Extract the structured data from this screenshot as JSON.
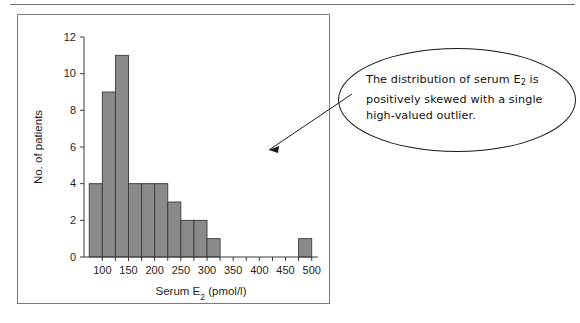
{
  "page": {
    "background": "#ffffff",
    "top_rule_color": "#6e6e6e"
  },
  "chart_panel": {
    "border_color": "#7a7a7a"
  },
  "callout": {
    "shape": "ellipse",
    "border_color": "#1a1a1a",
    "text_line_1": "The distribution of serum E",
    "text_sub_1": "2",
    "text_line_1b": " is",
    "text_line_2": "positively skewed with a single",
    "text_line_3": "high-valued outlier.",
    "full_text": "The distribution of serum E2 is positively skewed with a single high-valued outlier."
  },
  "annotation": {
    "arrow_color": "#1a1a1a",
    "arrow_from": "callout-ellipse-left",
    "arrow_to": "histogram-plot-area"
  },
  "chart_data": {
    "type": "bar",
    "subtype": "histogram",
    "title": "",
    "xlabel": "Serum E2 (pmol/l)",
    "xlabel_base": "Serum E",
    "xlabel_sub": "2",
    "xlabel_tail": " (pmol/l)",
    "ylabel": "No. of patients",
    "bar_color": "#8a8a8a",
    "bar_edge_color": "#3a3a3a",
    "axis_color": "#3a3a3a",
    "grid": false,
    "legend": "none",
    "xlim": [
      65,
      512
    ],
    "ylim": [
      0,
      12
    ],
    "ytick_values": [
      0,
      2,
      4,
      6,
      8,
      10,
      12
    ],
    "ytick_labels": [
      "0",
      "2",
      "4",
      "6",
      "8",
      "10",
      "12"
    ],
    "xtick_values": [
      100,
      125,
      150,
      175,
      200,
      225,
      250,
      275,
      300,
      325,
      350,
      375,
      400,
      425,
      450,
      475,
      500
    ],
    "xtick_labeled_values": [
      100,
      150,
      200,
      250,
      300,
      350,
      400,
      450,
      500
    ],
    "xtick_labels": [
      "100",
      "150",
      "200",
      "250",
      "300",
      "350",
      "400",
      "450",
      "500"
    ],
    "bin_width": 25,
    "bins": [
      {
        "start": 75,
        "end": 100,
        "count": 4
      },
      {
        "start": 100,
        "end": 125,
        "count": 9
      },
      {
        "start": 125,
        "end": 150,
        "count": 11
      },
      {
        "start": 150,
        "end": 175,
        "count": 4
      },
      {
        "start": 175,
        "end": 200,
        "count": 4
      },
      {
        "start": 200,
        "end": 225,
        "count": 4
      },
      {
        "start": 225,
        "end": 250,
        "count": 3
      },
      {
        "start": 250,
        "end": 275,
        "count": 2
      },
      {
        "start": 275,
        "end": 300,
        "count": 2
      },
      {
        "start": 300,
        "end": 325,
        "count": 1
      },
      {
        "start": 475,
        "end": 500,
        "count": 1
      }
    ],
    "categories": [
      "75-100",
      "100-125",
      "125-150",
      "150-175",
      "175-200",
      "200-225",
      "225-250",
      "250-275",
      "275-300",
      "300-325",
      "475-500"
    ],
    "values": [
      4,
      9,
      11,
      4,
      4,
      4,
      3,
      2,
      2,
      1,
      1
    ]
  }
}
